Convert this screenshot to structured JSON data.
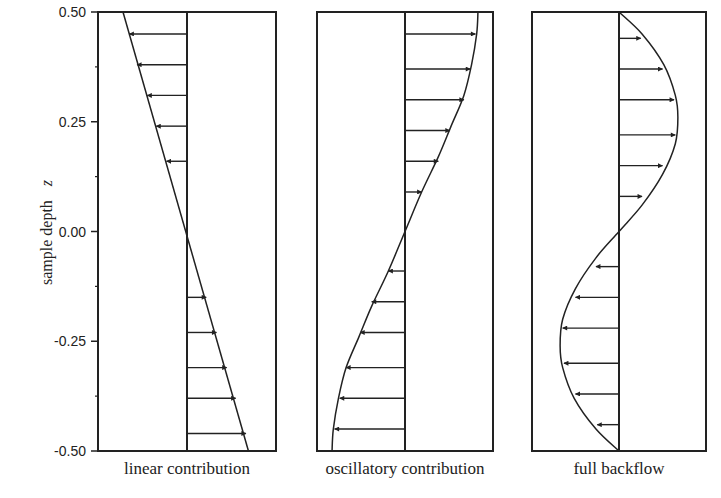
{
  "chart_data": [
    {
      "type": "line",
      "title": "",
      "xlabel": "linear contribution",
      "ylabel": "sample depth z",
      "ylim": [
        -0.5,
        0.5
      ],
      "yticks": [
        0.5,
        0.25,
        0.0,
        -0.25,
        -0.5
      ],
      "ytick_labels": [
        "0.50",
        "0.25",
        "0.00",
        "-0.25",
        "-0.50"
      ],
      "grid": false,
      "legend": null,
      "series": [
        {
          "name": "linear contribution profile",
          "z": [
            0.5,
            -0.5
          ],
          "u": [
            -0.5,
            0.48
          ]
        }
      ],
      "arrows": {
        "z": [
          0.45,
          0.38,
          0.31,
          0.24,
          0.16,
          -0.15,
          -0.23,
          -0.31,
          -0.38,
          -0.46
        ],
        "u": [
          -0.45,
          -0.39,
          -0.31,
          -0.24,
          -0.16,
          0.15,
          0.23,
          0.31,
          0.38,
          0.46
        ]
      }
    },
    {
      "type": "line",
      "title": "",
      "xlabel": "oscillatory contribution",
      "ylabel": "",
      "ylim": [
        -0.5,
        0.5
      ],
      "grid": false,
      "legend": null,
      "series": [
        {
          "name": "oscillatory contribution profile",
          "z": [
            0.5,
            0.45,
            0.38,
            0.31,
            0.24,
            0.17,
            0.09,
            0.0,
            -0.09,
            -0.17,
            -0.24,
            -0.31,
            -0.38,
            -0.45,
            -0.5
          ],
          "u": [
            0.57,
            0.56,
            0.52,
            0.46,
            0.36,
            0.26,
            0.13,
            0.0,
            -0.13,
            -0.26,
            -0.36,
            -0.46,
            -0.52,
            -0.56,
            -0.57
          ]
        }
      ],
      "arrows": {
        "z": [
          0.45,
          0.37,
          0.3,
          0.23,
          0.16,
          0.09,
          -0.09,
          -0.16,
          -0.23,
          -0.31,
          -0.38,
          -0.45
        ],
        "u": [
          0.55,
          0.51,
          0.46,
          0.35,
          0.26,
          0.13,
          -0.13,
          -0.26,
          -0.35,
          -0.46,
          -0.51,
          -0.55
        ]
      }
    },
    {
      "type": "line",
      "title": "",
      "xlabel": "full backflow",
      "ylabel": "",
      "ylim": [
        -0.5,
        0.5
      ],
      "grid": false,
      "legend": null,
      "series": [
        {
          "name": "full backflow profile",
          "z": [
            0.5,
            0.45,
            0.38,
            0.31,
            0.26,
            0.2,
            0.13,
            0.06,
            0.0,
            -0.06,
            -0.13,
            -0.2,
            -0.26,
            -0.31,
            -0.38,
            -0.45,
            -0.5
          ],
          "u": [
            0.0,
            0.18,
            0.35,
            0.44,
            0.46,
            0.44,
            0.34,
            0.18,
            0.0,
            -0.18,
            -0.34,
            -0.44,
            -0.46,
            -0.44,
            -0.35,
            -0.18,
            0.0
          ]
        }
      ],
      "arrows": {
        "z": [
          0.44,
          0.37,
          0.3,
          0.22,
          0.15,
          0.08,
          -0.08,
          -0.15,
          -0.22,
          -0.3,
          -0.37,
          -0.44
        ],
        "u": [
          0.17,
          0.34,
          0.43,
          0.44,
          0.34,
          0.18,
          -0.18,
          -0.34,
          -0.44,
          -0.43,
          -0.34,
          -0.17
        ]
      }
    }
  ],
  "figure": {
    "ylabel": "sample depth",
    "ylabel_var": "z",
    "panels": [
      "linear contribution",
      "oscillatory contribution",
      "full backflow"
    ]
  }
}
